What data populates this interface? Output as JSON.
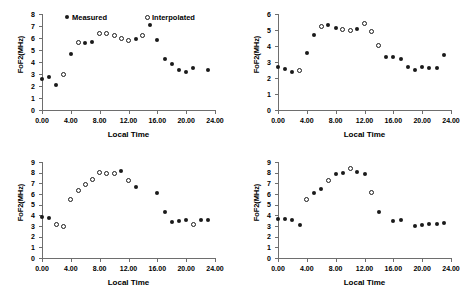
{
  "figure": {
    "panel_count": 4,
    "shared_xlabel": "Local Time",
    "shared_ylabel": "FoF2(MHz)",
    "legend": {
      "measured": "Measured",
      "interpolated": "Interpolated"
    },
    "colors": {
      "marker": "#1a1a1a",
      "axis": "#6e6e6e",
      "background": "#ffffff"
    }
  },
  "chart_data": [
    {
      "type": "scatter",
      "title": "",
      "xlabel": "Local Time",
      "ylabel": "FoF2(MHz)",
      "xlim": [
        0,
        24
      ],
      "ylim": [
        0,
        8
      ],
      "xticks": [
        "0.00",
        "4.00",
        "8.00",
        "12.00",
        "16.00",
        "20.00",
        "24.00"
      ],
      "xtick_values": [
        0,
        4,
        8,
        12,
        16,
        20,
        24
      ],
      "yticks": [
        "0",
        "1",
        "2",
        "3",
        "4",
        "5",
        "6",
        "7",
        "8"
      ],
      "ytick_values": [
        0,
        1,
        2,
        3,
        4,
        5,
        6,
        7,
        8
      ],
      "grid": false,
      "legend_position": "top",
      "series": [
        {
          "name": "Measured",
          "marker": "filled-circle",
          "x": [
            0,
            1,
            2,
            4,
            6,
            7,
            13,
            15,
            16,
            17,
            18,
            19,
            20,
            21,
            23
          ],
          "y": [
            2.6,
            2.75,
            2.05,
            4.7,
            5.55,
            5.7,
            5.95,
            7.1,
            5.85,
            4.25,
            3.85,
            3.3,
            3.2,
            3.5,
            3.35
          ]
        },
        {
          "name": "Interpolated",
          "marker": "open-circle",
          "x": [
            3,
            5,
            8,
            9,
            10,
            11,
            12,
            14
          ],
          "y": [
            3.0,
            5.6,
            6.35,
            6.4,
            6.25,
            5.95,
            5.8,
            6.25
          ]
        }
      ]
    },
    {
      "type": "scatter",
      "title": "",
      "xlabel": "Local Time",
      "ylabel": "FoF2(MHz)",
      "xlim": [
        0,
        24
      ],
      "ylim": [
        0,
        6
      ],
      "xticks": [
        "0.00",
        "4.00",
        "8.00",
        "12.00",
        "16.00",
        "20.00",
        "24.00"
      ],
      "xtick_values": [
        0,
        4,
        8,
        12,
        16,
        20,
        24
      ],
      "yticks": [
        "0",
        "1",
        "2",
        "3",
        "4",
        "5",
        "6"
      ],
      "ytick_values": [
        0,
        1,
        2,
        3,
        4,
        5,
        6
      ],
      "grid": false,
      "legend_position": "none",
      "series": [
        {
          "name": "Measured",
          "marker": "filled-circle",
          "x": [
            0,
            1,
            2,
            4,
            5,
            7,
            8,
            11,
            15,
            16,
            17,
            18,
            19,
            20,
            21,
            22,
            23
          ],
          "y": [
            2.7,
            2.55,
            2.4,
            3.55,
            4.7,
            5.3,
            5.1,
            5.05,
            3.3,
            3.3,
            3.2,
            2.7,
            2.5,
            2.7,
            2.6,
            2.6,
            3.45
          ]
        },
        {
          "name": "Interpolated",
          "marker": "open-circle",
          "x": [
            3,
            6,
            9,
            10,
            12,
            13,
            14
          ],
          "y": [
            2.5,
            5.25,
            5.05,
            4.95,
            5.4,
            4.9,
            4.05
          ]
        }
      ]
    },
    {
      "type": "scatter",
      "title": "",
      "xlabel": "Local Time",
      "ylabel": "FoF2(MHz)",
      "xlim": [
        0,
        24
      ],
      "ylim": [
        0,
        9
      ],
      "xticks": [
        "0.00",
        "4.00",
        "8.00",
        "12.00",
        "16.00",
        "20.00",
        "24.00"
      ],
      "xtick_values": [
        0,
        4,
        8,
        12,
        16,
        20,
        24
      ],
      "yticks": [
        "0",
        "1",
        "2",
        "3",
        "4",
        "5",
        "6",
        "7",
        "8",
        "9"
      ],
      "ytick_values": [
        0,
        1,
        2,
        3,
        4,
        5,
        6,
        7,
        8,
        9
      ],
      "grid": false,
      "legend_position": "none",
      "series": [
        {
          "name": "Measured",
          "marker": "filled-circle",
          "x": [
            0,
            1,
            11,
            13,
            16,
            17,
            18,
            19,
            20,
            22,
            23
          ],
          "y": [
            3.8,
            3.75,
            8.15,
            6.7,
            6.1,
            4.3,
            3.4,
            3.5,
            3.55,
            3.55,
            3.55
          ]
        },
        {
          "name": "Interpolated",
          "marker": "open-circle",
          "x": [
            2,
            3,
            4,
            5,
            6,
            7,
            8,
            9,
            10,
            12,
            21
          ],
          "y": [
            3.15,
            3.0,
            5.45,
            6.35,
            6.85,
            7.4,
            8.05,
            7.95,
            7.95,
            7.25,
            3.15
          ]
        }
      ]
    },
    {
      "type": "scatter",
      "title": "",
      "xlabel": "Local Time",
      "ylabel": "FoF2(MHz)",
      "xlim": [
        0,
        24
      ],
      "ylim": [
        0,
        9
      ],
      "xticks": [
        "0.00",
        "4.00",
        "8.00",
        "12.00",
        "16.00",
        "20.00",
        "24.00"
      ],
      "xtick_values": [
        0,
        4,
        8,
        12,
        16,
        20,
        24
      ],
      "yticks": [
        "0",
        "1",
        "2",
        "3",
        "4",
        "5",
        "6",
        "7",
        "8",
        "9"
      ],
      "ytick_values": [
        0,
        1,
        2,
        3,
        4,
        5,
        6,
        7,
        8,
        9
      ],
      "grid": false,
      "legend_position": "none",
      "series": [
        {
          "name": "Measured",
          "marker": "filled-circle",
          "x": [
            0,
            1,
            2,
            3,
            5,
            6,
            8,
            9,
            11,
            12,
            14,
            16,
            17,
            19,
            20,
            21,
            22,
            23
          ],
          "y": [
            3.65,
            3.7,
            3.55,
            3.1,
            6.05,
            6.5,
            7.85,
            7.95,
            8.1,
            7.85,
            4.35,
            3.5,
            3.55,
            3.0,
            3.05,
            3.15,
            3.15,
            3.3
          ]
        },
        {
          "name": "Interpolated",
          "marker": "open-circle",
          "x": [
            4,
            7,
            10,
            13
          ],
          "y": [
            5.45,
            7.3,
            8.4,
            6.15
          ]
        }
      ]
    }
  ]
}
